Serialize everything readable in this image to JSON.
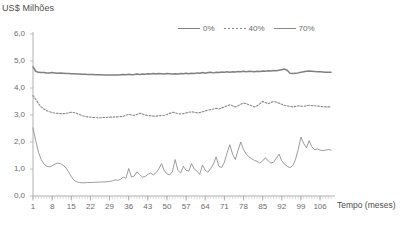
{
  "chart_data": {
    "type": "line",
    "title": "",
    "ylabel": "US$ Milhões",
    "xlabel": "Tempo (meses)",
    "ylim": [
      0.0,
      6.0
    ],
    "xlim": [
      1,
      110
    ],
    "grid": false,
    "legend_position": "top-center",
    "y_ticks": [
      "6,0",
      "5,0",
      "4,0",
      "3,0",
      "2,0",
      "1,0",
      "0,0"
    ],
    "y_tick_values": [
      6.0,
      5.0,
      4.0,
      3.0,
      2.0,
      1.0,
      0.0
    ],
    "x_ticks": [
      "1",
      "8",
      "15",
      "22",
      "29",
      "36",
      "43",
      "50",
      "57",
      "64",
      "71",
      "78",
      "85",
      "92",
      "99",
      "106"
    ],
    "x_tick_values": [
      1,
      8,
      15,
      22,
      29,
      36,
      43,
      50,
      57,
      64,
      71,
      78,
      85,
      92,
      99,
      106
    ],
    "series": [
      {
        "name": "0%",
        "style": "solid-thick",
        "color": "#808080",
        "values": [
          4.78,
          4.62,
          4.58,
          4.57,
          4.57,
          4.56,
          4.56,
          4.57,
          4.56,
          4.55,
          4.56,
          4.55,
          4.54,
          4.54,
          4.53,
          4.53,
          4.52,
          4.52,
          4.51,
          4.51,
          4.5,
          4.5,
          4.5,
          4.49,
          4.49,
          4.49,
          4.48,
          4.48,
          4.48,
          4.48,
          4.48,
          4.48,
          4.49,
          4.5,
          4.49,
          4.51,
          4.49,
          4.5,
          4.52,
          4.5,
          4.52,
          4.51,
          4.53,
          4.52,
          4.54,
          4.52,
          4.54,
          4.53,
          4.52,
          4.54,
          4.53,
          4.52,
          4.53,
          4.52,
          4.54,
          4.53,
          4.55,
          4.53,
          4.55,
          4.54,
          4.56,
          4.55,
          4.57,
          4.55,
          4.57,
          4.58,
          4.56,
          4.58,
          4.57,
          4.59,
          4.58,
          4.6,
          4.58,
          4.6,
          4.59,
          4.61,
          4.6,
          4.62,
          4.6,
          4.62,
          4.61,
          4.6,
          4.62,
          4.61,
          4.63,
          4.62,
          4.64,
          4.63,
          4.65,
          4.64,
          4.66,
          4.68,
          4.7,
          4.66,
          4.55,
          4.54,
          4.55,
          4.56,
          4.58,
          4.6,
          4.62,
          4.63,
          4.62,
          4.61,
          4.6,
          4.6,
          4.59,
          4.58,
          4.58,
          4.58
        ]
      },
      {
        "name": "40%",
        "style": "dotted",
        "color": "#8a8a8a",
        "values": [
          3.72,
          3.58,
          3.42,
          3.3,
          3.22,
          3.16,
          3.12,
          3.09,
          3.07,
          3.06,
          3.05,
          3.05,
          3.06,
          3.08,
          3.1,
          3.09,
          3.06,
          3.02,
          2.98,
          2.95,
          2.93,
          2.92,
          2.91,
          2.9,
          2.9,
          2.9,
          2.91,
          2.91,
          2.92,
          2.92,
          2.93,
          2.93,
          2.94,
          2.95,
          2.99,
          3.03,
          3.0,
          2.98,
          3.02,
          3.06,
          3.04,
          3.0,
          2.98,
          2.97,
          2.96,
          2.96,
          2.97,
          2.98,
          2.99,
          3.02,
          3.06,
          3.1,
          3.08,
          3.05,
          3.04,
          3.05,
          3.08,
          3.1,
          3.12,
          3.1,
          3.08,
          3.09,
          3.12,
          3.15,
          3.18,
          3.2,
          3.22,
          3.25,
          3.22,
          3.26,
          3.3,
          3.34,
          3.38,
          3.34,
          3.3,
          3.34,
          3.4,
          3.44,
          3.42,
          3.38,
          3.34,
          3.3,
          3.34,
          3.42,
          3.5,
          3.46,
          3.42,
          3.46,
          3.5,
          3.48,
          3.44,
          3.4,
          3.36,
          3.34,
          3.32,
          3.3,
          3.32,
          3.34,
          3.33,
          3.32,
          3.34,
          3.36,
          3.35,
          3.34,
          3.33,
          3.32,
          3.31,
          3.3,
          3.3,
          3.3
        ]
      },
      {
        "name": "70%",
        "style": "solid-thin",
        "color": "#8a8a8a",
        "values": [
          2.52,
          2.05,
          1.62,
          1.35,
          1.18,
          1.1,
          1.08,
          1.12,
          1.18,
          1.22,
          1.2,
          1.14,
          1.05,
          0.9,
          0.72,
          0.58,
          0.52,
          0.5,
          0.49,
          0.49,
          0.5,
          0.5,
          0.5,
          0.51,
          0.51,
          0.52,
          0.52,
          0.53,
          0.54,
          0.56,
          0.6,
          0.58,
          0.62,
          0.7,
          0.66,
          1.02,
          0.7,
          0.74,
          0.9,
          0.8,
          0.7,
          0.72,
          0.8,
          0.85,
          0.78,
          0.86,
          1.0,
          1.2,
          0.95,
          0.82,
          0.78,
          0.9,
          1.35,
          0.95,
          0.85,
          1.1,
          0.95,
          0.92,
          1.2,
          1.0,
          0.92,
          0.8,
          1.15,
          0.95,
          0.88,
          1.02,
          1.18,
          1.45,
          1.1,
          1.05,
          1.25,
          1.6,
          1.9,
          1.55,
          1.35,
          1.7,
          2.0,
          1.72,
          1.55,
          1.45,
          1.38,
          1.32,
          1.28,
          1.22,
          1.3,
          1.42,
          1.3,
          1.22,
          1.25,
          1.4,
          1.55,
          1.3,
          1.18,
          1.1,
          1.05,
          1.12,
          1.35,
          1.72,
          2.18,
          1.95,
          1.78,
          2.05,
          1.82,
          1.72,
          1.74,
          1.7,
          1.68,
          1.7,
          1.72,
          1.7
        ]
      }
    ]
  },
  "legend": {
    "entries": [
      {
        "label": "0%"
      },
      {
        "label": "40%"
      },
      {
        "label": "70%"
      }
    ]
  }
}
